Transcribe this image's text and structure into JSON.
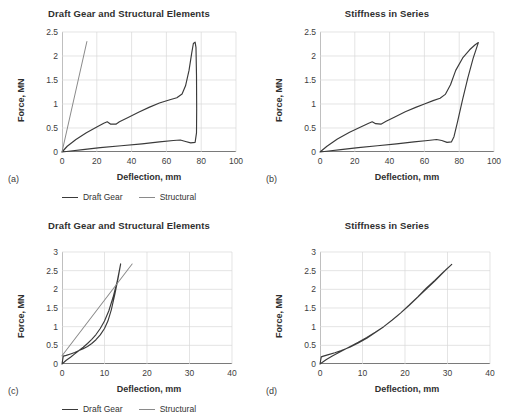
{
  "figure": {
    "panels": [
      "(a)",
      "(b)",
      "(c)",
      "(d)"
    ],
    "legend": {
      "draft_label": "Draft Gear",
      "structural_label": "Structural",
      "draft_color": "#3a3a3a",
      "structural_color": "#8a8a8a"
    }
  },
  "chart_data": [
    {
      "panel": "(a)",
      "type": "line",
      "title": "Draft Gear and Structural Elements",
      "xlabel": "Deflection, mm",
      "ylabel": "Force, MN",
      "xlim": [
        0,
        100
      ],
      "ylim": [
        0,
        2.5
      ],
      "xticks": [
        0,
        20,
        40,
        60,
        80,
        100
      ],
      "yticks": [
        0,
        0.5,
        1,
        1.5,
        2,
        2.5
      ],
      "grid": true,
      "legend_position": "bottom",
      "series": [
        {
          "name": "Draft Gear",
          "color": "#3a3a3a",
          "points": [
            [
              0,
              0.0
            ],
            [
              3,
              0.12
            ],
            [
              8,
              0.26
            ],
            [
              14,
              0.4
            ],
            [
              20,
              0.52
            ],
            [
              24,
              0.6
            ],
            [
              26,
              0.63
            ],
            [
              28,
              0.58
            ],
            [
              31,
              0.58
            ],
            [
              33,
              0.63
            ],
            [
              38,
              0.72
            ],
            [
              44,
              0.83
            ],
            [
              50,
              0.93
            ],
            [
              56,
              1.02
            ],
            [
              62,
              1.09
            ],
            [
              66,
              1.13
            ],
            [
              69,
              1.21
            ],
            [
              71,
              1.38
            ],
            [
              73,
              1.7
            ],
            [
              74.5,
              2.05
            ],
            [
              75.5,
              2.26
            ],
            [
              76.5,
              2.29
            ],
            [
              77,
              2.18
            ],
            [
              77.3,
              1.6
            ],
            [
              77.4,
              0.9
            ],
            [
              77.3,
              0.4
            ],
            [
              76.5,
              0.2
            ],
            [
              74,
              0.19
            ],
            [
              71,
              0.22
            ],
            [
              68,
              0.25
            ],
            [
              64,
              0.24
            ],
            [
              56,
              0.21
            ],
            [
              46,
              0.17
            ],
            [
              34,
              0.13
            ],
            [
              22,
              0.09
            ],
            [
              12,
              0.05
            ],
            [
              5,
              0.02
            ],
            [
              0,
              0.0
            ]
          ]
        },
        {
          "name": "Structural",
          "color": "#8a8a8a",
          "points": [
            [
              0,
              0.0
            ],
            [
              14.3,
              2.3
            ]
          ]
        }
      ]
    },
    {
      "panel": "(b)",
      "type": "line",
      "title": "Stiffness in Series",
      "xlabel": "Deflection, mm",
      "ylabel": "Force, MN",
      "xlim": [
        0,
        100
      ],
      "ylim": [
        0,
        2.5
      ],
      "xticks": [
        0,
        20,
        40,
        60,
        80,
        100
      ],
      "yticks": [
        0,
        0.5,
        1,
        1.5,
        2,
        2.5
      ],
      "grid": true,
      "legend_position": "none",
      "series": [
        {
          "name": "Series combined",
          "color": "#3a3a3a",
          "points": [
            [
              0,
              0.0
            ],
            [
              4,
              0.12
            ],
            [
              10,
              0.27
            ],
            [
              17,
              0.41
            ],
            [
              24,
              0.53
            ],
            [
              28,
              0.6
            ],
            [
              30,
              0.63
            ],
            [
              32,
              0.59
            ],
            [
              35,
              0.58
            ],
            [
              38,
              0.64
            ],
            [
              43,
              0.73
            ],
            [
              49,
              0.84
            ],
            [
              55,
              0.93
            ],
            [
              60,
              1.0
            ],
            [
              65,
              1.07
            ],
            [
              69,
              1.12
            ],
            [
              72,
              1.2
            ],
            [
              75,
              1.4
            ],
            [
              78,
              1.7
            ],
            [
              82,
              1.96
            ],
            [
              86,
              2.13
            ],
            [
              89,
              2.23
            ],
            [
              91,
              2.28
            ],
            [
              88,
              1.95
            ],
            [
              85,
              1.55
            ],
            [
              82,
              1.1
            ],
            [
              79,
              0.62
            ],
            [
              77,
              0.32
            ],
            [
              75.5,
              0.21
            ],
            [
              73,
              0.2
            ],
            [
              70,
              0.24
            ],
            [
              67,
              0.26
            ],
            [
              62,
              0.24
            ],
            [
              54,
              0.21
            ],
            [
              44,
              0.17
            ],
            [
              33,
              0.13
            ],
            [
              22,
              0.09
            ],
            [
              12,
              0.05
            ],
            [
              5,
              0.02
            ],
            [
              0,
              0.0
            ]
          ]
        }
      ]
    },
    {
      "panel": "(c)",
      "type": "line",
      "title": "Draft Gear and Structural Elements",
      "xlabel": "Deflection, mm",
      "ylabel": "Force, MN",
      "xlim": [
        0,
        40
      ],
      "ylim": [
        0,
        3
      ],
      "xticks": [
        0,
        10,
        20,
        30,
        40
      ],
      "yticks": [
        0,
        0.5,
        1,
        1.5,
        2,
        2.5,
        3
      ],
      "grid": true,
      "legend_position": "bottom",
      "series": [
        {
          "name": "Draft Gear",
          "color": "#3a3a3a",
          "points": [
            [
              0,
              0.0
            ],
            [
              1,
              0.1
            ],
            [
              2,
              0.18
            ],
            [
              3,
              0.27
            ],
            [
              4,
              0.36
            ],
            [
              5,
              0.45
            ],
            [
              6,
              0.55
            ],
            [
              7,
              0.66
            ],
            [
              8,
              0.79
            ],
            [
              9,
              0.95
            ],
            [
              10,
              1.15
            ],
            [
              11,
              1.42
            ],
            [
              12,
              1.78
            ],
            [
              13,
              2.22
            ],
            [
              13.8,
              2.68
            ],
            [
              13.2,
              2.3
            ],
            [
              12.4,
              1.85
            ],
            [
              11.6,
              1.45
            ],
            [
              10.8,
              1.15
            ],
            [
              10,
              0.95
            ],
            [
              9,
              0.78
            ],
            [
              8,
              0.65
            ],
            [
              7,
              0.55
            ],
            [
              6,
              0.47
            ],
            [
              5,
              0.41
            ],
            [
              4,
              0.36
            ],
            [
              3,
              0.31
            ],
            [
              2,
              0.27
            ],
            [
              1,
              0.23
            ],
            [
              0.3,
              0.21
            ],
            [
              0,
              0.0
            ]
          ]
        },
        {
          "name": "Structural",
          "color": "#8a8a8a",
          "points": [
            [
              0,
              0.22
            ],
            [
              16.5,
              2.68
            ]
          ]
        }
      ]
    },
    {
      "panel": "(d)",
      "type": "line",
      "title": "Stiffness in Series",
      "xlabel": "Deflection, mm",
      "ylabel": "Force, MN",
      "xlim": [
        0,
        40
      ],
      "ylim": [
        0,
        3
      ],
      "xticks": [
        0,
        10,
        20,
        30,
        40
      ],
      "yticks": [
        0,
        0.5,
        1,
        1.5,
        2,
        2.5,
        3
      ],
      "grid": true,
      "legend_position": "none",
      "series": [
        {
          "name": "Series combined",
          "color": "#3a3a3a",
          "points": [
            [
              0,
              0.0
            ],
            [
              1.5,
              0.12
            ],
            [
              3,
              0.22
            ],
            [
              5,
              0.34
            ],
            [
              7,
              0.46
            ],
            [
              9,
              0.58
            ],
            [
              11,
              0.71
            ],
            [
              13,
              0.85
            ],
            [
              15,
              1.0
            ],
            [
              17,
              1.18
            ],
            [
              19,
              1.37
            ],
            [
              21,
              1.58
            ],
            [
              23,
              1.8
            ],
            [
              25,
              2.03
            ],
            [
              27,
              2.24
            ],
            [
              29,
              2.46
            ],
            [
              31,
              2.67
            ],
            [
              29.5,
              2.51
            ],
            [
              27,
              2.22
            ],
            [
              24,
              1.9
            ],
            [
              21,
              1.57
            ],
            [
              18,
              1.27
            ],
            [
              15,
              1.0
            ],
            [
              13,
              0.84
            ],
            [
              11,
              0.69
            ],
            [
              9,
              0.56
            ],
            [
              7,
              0.45
            ],
            [
              5,
              0.36
            ],
            [
              3.5,
              0.3
            ],
            [
              2,
              0.25
            ],
            [
              0.8,
              0.21
            ],
            [
              0.3,
              0.19
            ],
            [
              0,
              0.0
            ]
          ]
        }
      ]
    }
  ]
}
